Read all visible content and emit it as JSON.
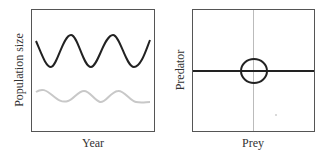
{
  "left_panel": {
    "xlabel": "Year",
    "ylabel": "Population size",
    "series": [
      {
        "name": "predator",
        "color": "#222222"
      },
      {
        "name": "prey",
        "color": "#c8c8c8"
      }
    ]
  },
  "right_panel": {
    "xlabel": "Prey",
    "ylabel": "Predator",
    "axis_color": "#bbbbbb",
    "nullcline_color": "#222222",
    "cycle_color": "#222222"
  }
}
